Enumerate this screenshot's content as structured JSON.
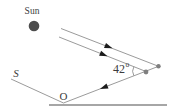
{
  "window": {
    "width": 170,
    "height": 112
  },
  "figure": {
    "type": "physics-ray-diagram",
    "labels": {
      "sun": "Sun",
      "source": "S",
      "observer": "O",
      "angle_value": "42",
      "angle_unit": "o"
    },
    "angle_degrees": 42,
    "colors": {
      "background": "#ffffff",
      "ray": "#9b9b9b",
      "arrow": "#1b1b1b",
      "sun": "#4d4d4d",
      "droplet": "#7f7f7f",
      "ground": "#a6a6a6",
      "text": "#3c3c3c"
    }
  }
}
